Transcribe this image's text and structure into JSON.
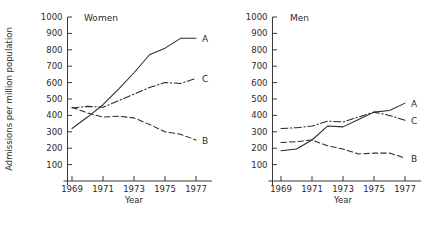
{
  "figure": {
    "ylabel": "Admissions per million population",
    "xlabel_left": "Year",
    "xlabel_right": "Year"
  },
  "chart_data": [
    {
      "type": "line",
      "title": "Women",
      "xlabel": "Year",
      "ylabel": "Admissions per million population",
      "x": [
        1969,
        1970,
        1971,
        1972,
        1973,
        1974,
        1975,
        1976,
        1977
      ],
      "xlim": [
        1968.5,
        1977.8
      ],
      "ylim": [
        0,
        1000
      ],
      "yticks": [
        100,
        200,
        300,
        400,
        500,
        600,
        700,
        800,
        900,
        1000
      ],
      "xticks": [
        1969,
        1971,
        1973,
        1975,
        1977
      ],
      "grid": false,
      "legend": "right-edge-labels",
      "series": [
        {
          "name": "A",
          "style": "solid",
          "values": [
            320,
            390,
            465,
            560,
            660,
            770,
            810,
            870,
            870
          ]
        },
        {
          "name": "B",
          "style": "dashed",
          "values": [
            450,
            415,
            390,
            395,
            385,
            345,
            300,
            285,
            250
          ]
        },
        {
          "name": "C",
          "style": "dashdot",
          "values": [
            445,
            455,
            450,
            490,
            530,
            570,
            600,
            595,
            625
          ]
        }
      ]
    },
    {
      "type": "line",
      "title": "Men",
      "xlabel": "Year",
      "ylabel": "Admissions per million population",
      "x": [
        1969,
        1970,
        1971,
        1972,
        1973,
        1974,
        1975,
        1976,
        1977
      ],
      "xlim": [
        1968.5,
        1977.8
      ],
      "ylim": [
        0,
        1000
      ],
      "yticks": [
        100,
        200,
        300,
        400,
        500,
        600,
        700,
        800,
        900,
        1000
      ],
      "xticks": [
        1969,
        1971,
        1973,
        1975,
        1977
      ],
      "grid": false,
      "legend": "right-edge-labels",
      "series": [
        {
          "name": "A",
          "style": "solid",
          "values": [
            185,
            195,
            250,
            335,
            330,
            375,
            420,
            430,
            475
          ]
        },
        {
          "name": "B",
          "style": "dashed",
          "values": [
            235,
            240,
            250,
            215,
            195,
            165,
            170,
            170,
            140
          ]
        },
        {
          "name": "C",
          "style": "dashdot",
          "values": [
            320,
            325,
            335,
            365,
            360,
            390,
            420,
            400,
            370
          ]
        }
      ]
    }
  ],
  "ticks": {
    "y_labels": [
      "1000",
      "900",
      "800",
      "700",
      "600",
      "500",
      "400",
      "300",
      "200",
      "100"
    ],
    "x_labels": [
      "1969",
      "1971",
      "1973",
      "1975",
      "1977"
    ]
  },
  "labels": {
    "women_title": "Women",
    "men_title": "Men",
    "series_A": "A",
    "series_B": "B",
    "series_C": "C"
  },
  "colors": {
    "ink": "#2b2b2b",
    "background": "#ffffff"
  }
}
